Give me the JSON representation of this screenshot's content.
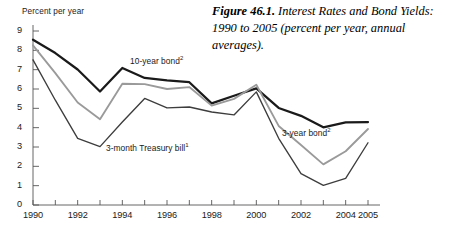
{
  "caption": {
    "figure_number": "Figure 46.1.",
    "text": " Interest Rates and Bond Yields: 1990 to 2005 (percent per year, annual averages)."
  },
  "axis": {
    "y_title": "Percent per year",
    "y_ticks": [
      "0",
      "1",
      "2",
      "3",
      "4",
      "5",
      "6",
      "7",
      "8",
      "9"
    ],
    "x_labels": [
      "1990",
      "1992",
      "1994",
      "1996",
      "1998",
      "2000",
      "2002",
      "2004",
      "2005"
    ]
  },
  "annotations": {
    "ten_year": {
      "text": "10-year bond",
      "superscript": "2"
    },
    "three_month": {
      "text": "3-month Treasury bill",
      "superscript": "1"
    },
    "three_year": {
      "text": "3-year bond",
      "superscript": "2"
    }
  },
  "colors": {
    "ten_year_bond": "#1a1a1a",
    "three_year_bond": "#9a9a9a",
    "three_month_bill": "#3d3d3d",
    "axis": "#555555",
    "background": "#ffffff"
  },
  "chart_data": {
    "type": "line",
    "title": "Figure 46.1. Interest Rates and Bond Yields: 1990 to 2005 (percent per year, annual averages).",
    "xlabel": "",
    "ylabel": "Percent per year",
    "x": [
      1990,
      1991,
      1992,
      1993,
      1994,
      1995,
      1996,
      1997,
      1998,
      1999,
      2000,
      2001,
      2002,
      2003,
      2004,
      2005
    ],
    "xlim": [
      1990,
      2005
    ],
    "ylim": [
      0,
      9
    ],
    "ytick_step": 1,
    "grid": false,
    "legend": "inline-annotations",
    "series": [
      {
        "name": "10-year bond",
        "footnote": "2",
        "color": "#1a1a1a",
        "values": [
          8.55,
          7.86,
          7.01,
          5.87,
          7.09,
          6.57,
          6.44,
          6.35,
          5.26,
          5.65,
          6.03,
          5.02,
          4.61,
          4.02,
          4.27,
          4.29
        ]
      },
      {
        "name": "3-year bond",
        "footnote": "2",
        "color": "#9a9a9a",
        "values": [
          8.26,
          6.82,
          5.3,
          4.44,
          6.27,
          6.25,
          6.0,
          6.1,
          5.14,
          5.49,
          6.22,
          4.09,
          3.1,
          2.1,
          2.78,
          3.93
        ]
      },
      {
        "name": "3-month Treasury bill",
        "footnote": "1",
        "color": "#3d3d3d",
        "values": [
          7.51,
          5.42,
          3.45,
          3.02,
          4.29,
          5.51,
          5.02,
          5.07,
          4.81,
          4.66,
          5.85,
          3.45,
          1.62,
          1.02,
          1.38,
          3.22
        ]
      }
    ]
  }
}
